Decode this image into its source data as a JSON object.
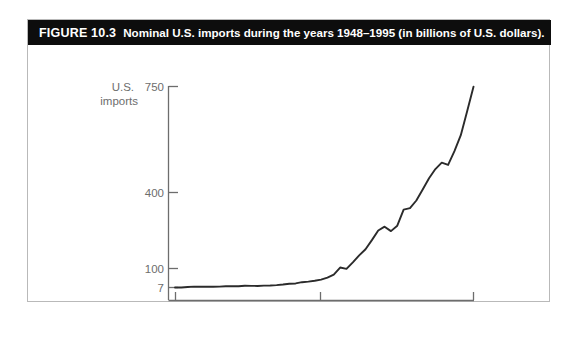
{
  "figure": {
    "number": "FIGURE 10.3",
    "caption": "Nominal U.S. imports during the years 1948–1995 (in billions of U.S. dollars).",
    "banner_color": "#0d0d0d",
    "border_color": "#b9b9b9",
    "line_color": "#2b2b2b",
    "axis_color": "#6d6d6d",
    "label_color": "#6d6d6d"
  },
  "chart_data": {
    "type": "line",
    "title": "Nominal U.S. imports during the years 1948–1995 (in billions of U.S. dollars)",
    "xlabel": "year",
    "ylabel": "U.S. imports",
    "grid": false,
    "legend": "none",
    "xlim": [
      1948,
      1995
    ],
    "ylim": [
      7,
      750
    ],
    "xticks": [
      1948,
      1972,
      1995
    ],
    "xticklabels": [
      "1948",
      "1972",
      "1995"
    ],
    "yticks": [
      7,
      100,
      400,
      750
    ],
    "yticklabels": [
      "7",
      "100",
      "400",
      "750"
    ],
    "yscale": "power (compressed at high end)",
    "x": [
      1948,
      1949,
      1950,
      1951,
      1952,
      1953,
      1954,
      1955,
      1956,
      1957,
      1958,
      1959,
      1960,
      1961,
      1962,
      1963,
      1964,
      1965,
      1966,
      1967,
      1968,
      1969,
      1970,
      1971,
      1972,
      1973,
      1974,
      1975,
      1976,
      1977,
      1978,
      1979,
      1980,
      1981,
      1982,
      1983,
      1984,
      1985,
      1986,
      1987,
      1988,
      1989,
      1990,
      1991,
      1992,
      1993,
      1994,
      1995
    ],
    "values": [
      7.1,
      6.6,
      9.1,
      11.2,
      10.8,
      11.0,
      10.4,
      11.5,
      12.8,
      13.3,
      13.0,
      15.3,
      15.0,
      14.7,
      16.4,
      17.1,
      18.7,
      21.5,
      25.5,
      26.9,
      33.0,
      36.0,
      40.0,
      45.6,
      55.8,
      70.5,
      103.8,
      98.2,
      124.2,
      151.9,
      176.0,
      212.0,
      249.8,
      265.1,
      247.6,
      268.9,
      332.4,
      338.1,
      368.4,
      409.8,
      447.2,
      477.4,
      498.4,
      491.0,
      536.5,
      589.4,
      668.6,
      749.4
    ],
    "annotations": [
      {
        "text": "flat growth through 1970s onset",
        "x_range": [
          1948,
          1970
        ]
      },
      {
        "text": "dip at 1975 recession",
        "x": 1975
      },
      {
        "text": "dip at 1982 recession",
        "x": 1982
      },
      {
        "text": "steep acceleration after 1992",
        "x_range": [
          1992,
          1995
        ]
      }
    ]
  },
  "axes": {
    "y_label_line1": "U.S.",
    "y_label_line2": "imports",
    "x_axis_label": "year"
  }
}
